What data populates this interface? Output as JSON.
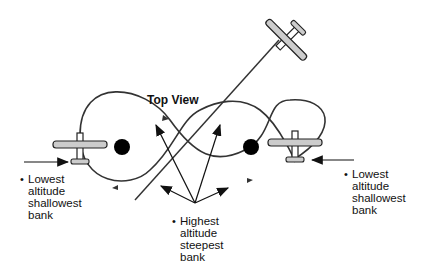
{
  "title": "Top View",
  "labels": {
    "left": {
      "lines": [
        "Lowest",
        "altitude",
        "shallowest",
        "bank"
      ]
    },
    "center": {
      "lines": [
        "Highest",
        "altitude",
        "steepest",
        "bank"
      ]
    },
    "right": {
      "lines": [
        "Lowest",
        "altitude",
        "shallowest",
        "bank"
      ]
    }
  },
  "bullet": "•",
  "colors": {
    "line": "#222222",
    "pylon": "#000000",
    "wing_fill": "#cccccc"
  }
}
